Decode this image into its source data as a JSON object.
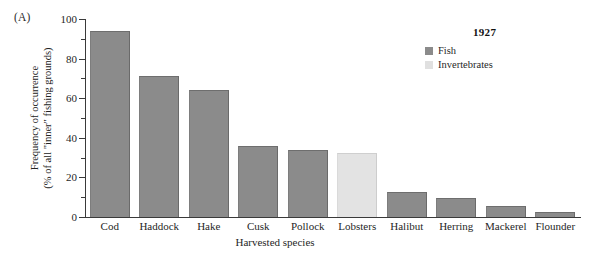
{
  "panel": {
    "label": "(A)"
  },
  "legend": {
    "title": "1927",
    "items": [
      {
        "label": "Fish",
        "color": "#8b8b8b",
        "swatch": "fish-swatch"
      },
      {
        "label": "Invertebrates",
        "color": "#e0e0e0",
        "swatch": "invertebrates-swatch"
      }
    ]
  },
  "axes": {
    "ylabel_line1": "Frequency of occurrence",
    "ylabel_line2": "(% of all \"inner\" fishing grounds)",
    "xlabel": "Harvested species",
    "yticks": [
      "0",
      "20",
      "40",
      "60",
      "80",
      "100"
    ]
  },
  "chart_data": {
    "type": "bar",
    "title": "",
    "subtitle": "",
    "xlabel": "Harvested species",
    "ylabel": "Frequency of occurrence (% of all \"inner\" fishing grounds)",
    "ylim": [
      0,
      100
    ],
    "ytick_values": [
      0,
      20,
      40,
      60,
      80,
      100
    ],
    "yminor_tick_step": 10,
    "grid": false,
    "legend_position": "top-right",
    "legend_title": "1927",
    "categories": [
      "Cod",
      "Haddock",
      "Hake",
      "Cusk",
      "Pollock",
      "Lobsters",
      "Halibut",
      "Herring",
      "Mackerel",
      "Flounder"
    ],
    "values": [
      94,
      71,
      64,
      36,
      34,
      32.5,
      12.5,
      9.5,
      5.5,
      2.5
    ],
    "groups": [
      "Fish",
      "Fish",
      "Fish",
      "Fish",
      "Fish",
      "Invertebrates",
      "Fish",
      "Fish",
      "Fish",
      "Fish"
    ],
    "series": [
      {
        "name": "Fish",
        "color": "#8b8b8b"
      },
      {
        "name": "Invertebrates",
        "color": "#e0e0e0"
      }
    ]
  }
}
